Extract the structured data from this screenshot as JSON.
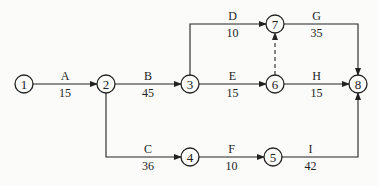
{
  "diagram": {
    "type": "activity-on-arrow network",
    "nodes": [
      {
        "id": "1",
        "label": "1",
        "x": 24,
        "y": 84
      },
      {
        "id": "2",
        "label": "2",
        "x": 106,
        "y": 84
      },
      {
        "id": "3",
        "label": "3",
        "x": 190,
        "y": 84
      },
      {
        "id": "4",
        "label": "4",
        "x": 190,
        "y": 157
      },
      {
        "id": "5",
        "label": "5",
        "x": 273,
        "y": 157
      },
      {
        "id": "6",
        "label": "6",
        "x": 275,
        "y": 84
      },
      {
        "id": "7",
        "label": "7",
        "x": 275,
        "y": 24
      },
      {
        "id": "8",
        "label": "8",
        "x": 358,
        "y": 84
      }
    ],
    "activities": [
      {
        "name": "A",
        "duration": "15",
        "from": "1",
        "to": "2"
      },
      {
        "name": "B",
        "duration": "45",
        "from": "2",
        "to": "3"
      },
      {
        "name": "C",
        "duration": "36",
        "from": "2",
        "to": "4"
      },
      {
        "name": "D",
        "duration": "10",
        "from": "3",
        "to": "7"
      },
      {
        "name": "E",
        "duration": "15",
        "from": "3",
        "to": "6"
      },
      {
        "name": "F",
        "duration": "10",
        "from": "4",
        "to": "5"
      },
      {
        "name": "G",
        "duration": "35",
        "from": "7",
        "to": "8"
      },
      {
        "name": "H",
        "duration": "15",
        "from": "6",
        "to": "8"
      },
      {
        "name": "I",
        "duration": "42",
        "from": "5",
        "to": "8"
      }
    ],
    "dummies": [
      {
        "from": "6",
        "to": "7",
        "style": "dashed"
      }
    ],
    "colors": {
      "line": "#222222",
      "background": "#fbfbfa"
    }
  }
}
